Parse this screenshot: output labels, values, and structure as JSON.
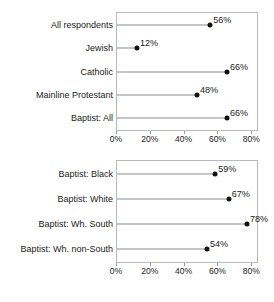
{
  "chart_data": [
    {
      "type": "bar",
      "title": "",
      "subtitle": "",
      "xlabel": "",
      "ylabel": "",
      "xlim": [
        0,
        84
      ],
      "grid": false,
      "legend": null,
      "orientation": "horizontal",
      "style": "lollipop",
      "categories": [
        "All respondents",
        "Jewish",
        "Catholic",
        "Mainline Protestant",
        "Baptist: All"
      ],
      "values": [
        56,
        12,
        66,
        48,
        66
      ],
      "data_labels": [
        "56%",
        "12%",
        "66%",
        "48%",
        "66%"
      ],
      "xticks": [
        0,
        20,
        40,
        60,
        80
      ],
      "xtick_labels": [
        "0%",
        "20%",
        "40%",
        "60%",
        "80%"
      ]
    },
    {
      "type": "bar",
      "title": "",
      "subtitle": "",
      "xlabel": "",
      "ylabel": "",
      "xlim": [
        0,
        84
      ],
      "grid": false,
      "legend": null,
      "orientation": "horizontal",
      "style": "lollipop",
      "categories": [
        "Baptist: Black",
        "Baptist: White",
        "Baptist: Wh. South",
        "Baptist: Wh. non-South"
      ],
      "values": [
        59,
        67,
        78,
        54
      ],
      "data_labels": [
        "59%",
        "67%",
        "78%",
        "54%"
      ],
      "xticks": [
        0,
        20,
        40,
        60,
        80
      ],
      "xtick_labels": [
        "0%",
        "20%",
        "40%",
        "60%",
        "80%"
      ]
    }
  ],
  "colors": {
    "dot": "#111111",
    "stem": "#8c8c8c",
    "plot_border": "#b9b9b9",
    "text": "#1a1a1a",
    "background": "#ffffff"
  }
}
